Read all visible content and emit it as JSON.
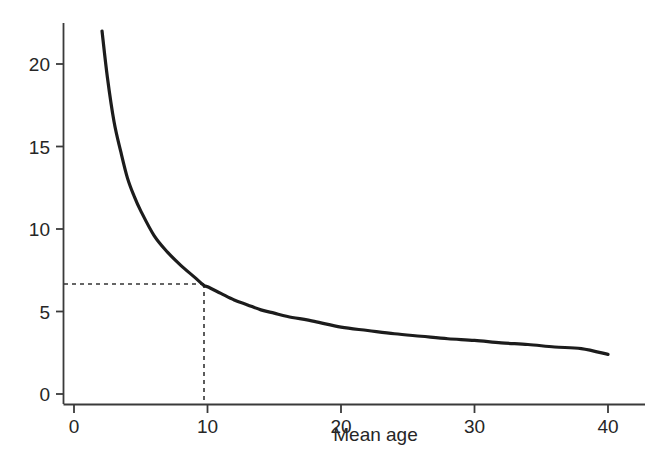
{
  "figure": {
    "background_color": "#ffffff",
    "curve_color": "#1c1c1c",
    "axis_color": "#3a3a3a",
    "guide_color": "#333333"
  },
  "chart_data": {
    "type": "line",
    "title": "",
    "subtitle": "",
    "xlabel": "Mean age",
    "ylabel": "",
    "xlim": [
      0,
      41
    ],
    "ylim": [
      0,
      23
    ],
    "grid": false,
    "legend": null,
    "legend_position": "none",
    "x_ticks": [
      0,
      10,
      20,
      30,
      40
    ],
    "x_tick_labels": [
      "0",
      "10",
      "20",
      "30",
      "40"
    ],
    "y_ticks": [
      0,
      5,
      10,
      15,
      20
    ],
    "y_tick_labels": [
      "0",
      "5",
      "10",
      "15",
      "20"
    ],
    "series": [
      {
        "name": "curve",
        "style": "solid",
        "x": [
          2.1,
          2.5,
          3,
          3.5,
          4,
          4.5,
          5,
          6,
          7,
          8,
          9,
          9.7,
          10,
          11,
          12,
          13,
          14,
          15,
          16,
          18,
          20,
          22,
          24,
          26,
          28,
          30,
          32,
          34,
          36,
          38,
          40
        ],
        "y": [
          22.0,
          19.2,
          16.5,
          14.7,
          13.1,
          12.0,
          11.1,
          9.6,
          8.6,
          7.8,
          7.1,
          6.6,
          6.5,
          6.1,
          5.7,
          5.4,
          5.1,
          4.9,
          4.7,
          4.4,
          4.05,
          3.85,
          3.65,
          3.5,
          3.35,
          3.25,
          3.1,
          3.0,
          2.85,
          2.75,
          2.4
        ]
      }
    ],
    "annotations": [
      {
        "name": "reference-lines",
        "style": "dashed",
        "x_value": 9.7,
        "y_value": 6.6,
        "description": "Dashed horizontal line from y-axis at 6.6 to the curve, and dashed vertical line down to x-axis at mean age 9.7"
      }
    ]
  }
}
